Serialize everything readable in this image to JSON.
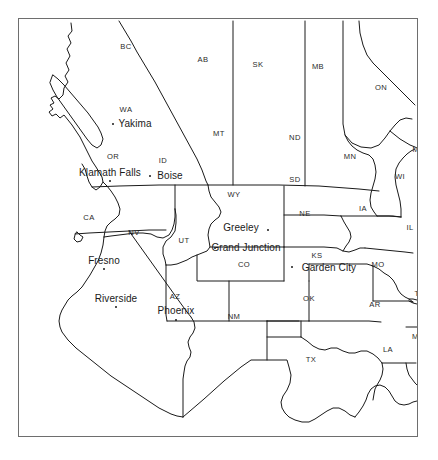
{
  "figure": {
    "background_color": "#ffffff",
    "frame_color": "#6e6e6e",
    "line_color": "#1a1a1a",
    "width": 438,
    "height": 460
  },
  "map": {
    "projection_note": "conic, western North America",
    "state_labels": [
      {
        "abbr": "BC",
        "x": 126,
        "y": 47
      },
      {
        "abbr": "AB",
        "x": 203,
        "y": 60
      },
      {
        "abbr": "SK",
        "x": 258,
        "y": 65
      },
      {
        "abbr": "MB",
        "x": 318,
        "y": 67
      },
      {
        "abbr": "ON",
        "x": 381,
        "y": 88
      },
      {
        "abbr": "WA",
        "x": 126,
        "y": 110
      },
      {
        "abbr": "MT",
        "x": 219,
        "y": 134
      },
      {
        "abbr": "ND",
        "x": 295,
        "y": 138
      },
      {
        "abbr": "MN",
        "x": 350,
        "y": 157
      },
      {
        "abbr": "MI",
        "x": 417,
        "y": 150
      },
      {
        "abbr": "OR",
        "x": 113,
        "y": 157
      },
      {
        "abbr": "ID",
        "x": 163,
        "y": 161
      },
      {
        "abbr": "SD",
        "x": 295,
        "y": 180
      },
      {
        "abbr": "WI",
        "x": 400,
        "y": 177
      },
      {
        "abbr": "WY",
        "x": 234,
        "y": 195
      },
      {
        "abbr": "NE",
        "x": 305,
        "y": 214
      },
      {
        "abbr": "IA",
        "x": 363,
        "y": 209
      },
      {
        "abbr": "CA",
        "x": 89,
        "y": 218
      },
      {
        "abbr": "NV",
        "x": 134,
        "y": 233
      },
      {
        "abbr": "IL",
        "x": 410,
        "y": 228
      },
      {
        "abbr": "UT",
        "x": 184,
        "y": 241
      },
      {
        "abbr": "CO",
        "x": 244,
        "y": 265
      },
      {
        "abbr": "KS",
        "x": 317,
        "y": 256
      },
      {
        "abbr": "MO",
        "x": 378,
        "y": 265
      },
      {
        "abbr": "AZ",
        "x": 175,
        "y": 297
      },
      {
        "abbr": "NM",
        "x": 234,
        "y": 317
      },
      {
        "abbr": "OK",
        "x": 309,
        "y": 299
      },
      {
        "abbr": "AR",
        "x": 375,
        "y": 305
      },
      {
        "abbr": "TN",
        "x": 420,
        "y": 294
      },
      {
        "abbr": "TX",
        "x": 311,
        "y": 360
      },
      {
        "abbr": "LA",
        "x": 388,
        "y": 350
      },
      {
        "abbr": "MS",
        "x": 418,
        "y": 337
      }
    ],
    "cities": [
      {
        "name": "Yakima",
        "label_x": 135,
        "label_y": 124,
        "dot_x": 113,
        "dot_y": 124,
        "dot_side": "left"
      },
      {
        "name": "Klamath Falls",
        "label_x": 110,
        "label_y": 173,
        "dot_x": 110,
        "dot_y": 181,
        "dot_side": "below"
      },
      {
        "name": "Boise",
        "label_x": 170,
        "label_y": 176,
        "dot_x": 150,
        "dot_y": 176,
        "dot_side": "left"
      },
      {
        "name": "Fresno",
        "label_x": 104,
        "label_y": 261,
        "dot_x": 104,
        "dot_y": 269,
        "dot_side": "below"
      },
      {
        "name": "Greeley",
        "label_x": 241,
        "label_y": 228,
        "dot_x": 268,
        "dot_y": 230,
        "dot_side": "right"
      },
      {
        "name": "Grand Junction",
        "label_x": 246,
        "label_y": 248,
        "dot_x": 215,
        "dot_y": 248,
        "dot_side": "left"
      },
      {
        "name": "Garden City",
        "label_x": 329,
        "label_y": 268,
        "dot_x": 292,
        "dot_y": 267,
        "dot_side": "left"
      },
      {
        "name": "Riverside",
        "label_x": 116,
        "label_y": 299,
        "dot_x": 116,
        "dot_y": 307,
        "dot_side": "below"
      },
      {
        "name": "Phoenix",
        "label_x": 176,
        "label_y": 311,
        "dot_x": 176,
        "dot_y": 320,
        "dot_side": "below"
      }
    ]
  }
}
